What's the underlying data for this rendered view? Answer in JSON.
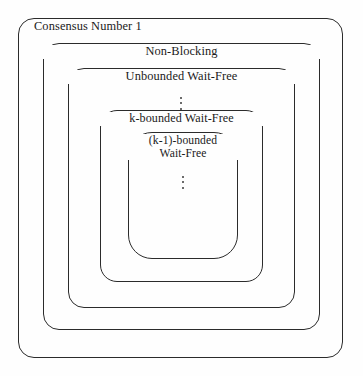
{
  "figure": {
    "type": "nested-containment-diagram",
    "title_text": "",
    "background_color": "#fefefe",
    "stroke_color": "#2b2b2b",
    "levels": [
      {
        "id": "consensus-number-1",
        "label": "Consensus Number 1",
        "label_align": "left"
      },
      {
        "id": "non-blocking",
        "label": "Non-Blocking",
        "label_align": "center"
      },
      {
        "id": "unbounded-wait-free",
        "label": "Unbounded Wait-Free",
        "label_align": "center"
      },
      {
        "id": "k-bounded-wait-free",
        "label": "k-bounded Wait-Free",
        "label_align": "center"
      },
      {
        "id": "k-minus-1-bounded-wait-free",
        "label_line1": "(k-1)-bounded",
        "label_line2": "Wait-Free",
        "label_align": "center"
      }
    ],
    "ellipses": [
      {
        "id": "ellipsis-between-unbounded-and-k-bounded",
        "glyph": "vertical-ellipsis"
      },
      {
        "id": "ellipsis-inside-innermost",
        "glyph": "vertical-ellipsis"
      }
    ]
  },
  "chart_data": {
    "type": "diagram",
    "subtype": "nested set containment (Venn-style concentric boxes)",
    "title": "Consensus Number 1",
    "categories": [
      "Consensus Number 1",
      "Non-Blocking",
      "Unbounded Wait-Free",
      "k-bounded Wait-Free",
      "(k-1)-bounded Wait-Free"
    ],
    "nesting_order_outermost_to_innermost": [
      "Consensus Number 1",
      "Non-Blocking",
      "Unbounded Wait-Free",
      "k-bounded Wait-Free",
      "(k-1)-bounded Wait-Free"
    ],
    "relation": "each inner region is a strict subset of the region enclosing it",
    "omitted_level_markers": 2,
    "legend": [],
    "grid": false,
    "xlabel": "",
    "ylabel": ""
  }
}
